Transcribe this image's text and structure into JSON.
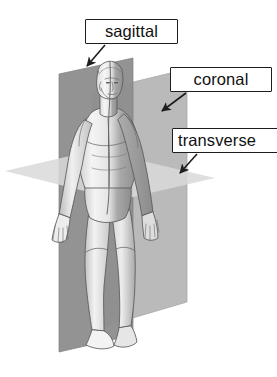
{
  "diagram": {
    "background_color": "#ffffff"
  },
  "labels": [
    {
      "id": "sagittal",
      "text": "sagittal",
      "box": {
        "x": 85,
        "y": 19,
        "width": 93,
        "height": 25
      },
      "arrow": {
        "from_x": 105,
        "from_y": 45,
        "to_x": 87,
        "to_y": 66
      }
    },
    {
      "id": "coronal",
      "text": "coronal",
      "box": {
        "x": 170,
        "y": 67,
        "width": 102,
        "height": 25
      },
      "arrow": {
        "from_x": 186,
        "from_y": 93,
        "to_x": 162,
        "to_y": 111
      }
    },
    {
      "id": "transverse",
      "text": "transverse",
      "box": {
        "x": 172,
        "y": 128,
        "width": 112,
        "height": 25
      },
      "arrow": {
        "from_x": 197,
        "from_y": 154,
        "to_x": 180,
        "to_y": 173
      }
    }
  ],
  "planes": [
    {
      "id": "sagittal-plane",
      "name": "sagittal plane",
      "orientation": "vertical, divides left and right",
      "color": "#8f8f8f",
      "shape": "parallelogram receding back-left"
    },
    {
      "id": "coronal-plane",
      "name": "coronal plane",
      "orientation": "vertical, divides front and back",
      "color": "#b6b6b6",
      "shape": "vertical rectangle behind figure"
    },
    {
      "id": "transverse-plane",
      "name": "transverse plane",
      "orientation": "horizontal, divides upper and lower",
      "color": "#d8d8d8",
      "shape": "horizontal parallelogram at hip level"
    }
  ],
  "figure": {
    "id": "human-body",
    "fill_light": "#efefef",
    "fill_shadow": "#9a9a9a",
    "outline": "#4a4a4a"
  },
  "colors": {
    "label_border": "#1d1d1d",
    "label_text": "#111111",
    "arrow": "#1d1d1d"
  }
}
